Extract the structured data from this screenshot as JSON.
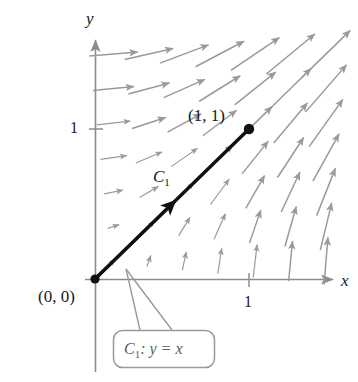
{
  "figure": {
    "axes": {
      "x_label": "x",
      "y_label": "y",
      "x_tick_label": "1",
      "y_tick_label": "1"
    },
    "points": {
      "origin_label": "(0, 0)",
      "endpoint_label": "(1, 1)"
    },
    "curve": {
      "label": "C",
      "label_sub": "1",
      "callout_name": "C",
      "callout_sub": "1",
      "callout_equation": ": y = x"
    },
    "colors": {
      "axis": "#8c8c8c",
      "field_arrow": "#9a9a9a",
      "curve": "#101010",
      "callout_border": "#9a9a9a",
      "callout_text": "#5e5e5e",
      "text": "#171717",
      "background": "#ffffff"
    }
  },
  "chart_data": {
    "type": "scatter",
    "title": "",
    "xlabel": "x",
    "ylabel": "y",
    "xlim": [
      -0.22,
      1.72
    ],
    "ylim": [
      -0.55,
      1.75
    ],
    "grid": false,
    "legend": null,
    "vector_field": {
      "description": "F = <y, x>",
      "fx": "y",
      "fy": "x",
      "grid_x": [
        0.12,
        0.35,
        0.58,
        0.81,
        1.04,
        1.27,
        1.5
      ],
      "grid_y": [
        0.12,
        0.35,
        0.58,
        0.81,
        1.04,
        1.27,
        1.5
      ],
      "arrow_scale": 0.21,
      "color": "#9a9a9a"
    },
    "curves": [
      {
        "name": "C1",
        "equation": "y = x",
        "from": [
          0,
          0
        ],
        "to": [
          1,
          1
        ],
        "direction": "increasing",
        "color": "#101010",
        "endpoints_marked": [
          [
            0,
            0
          ],
          [
            1,
            1
          ]
        ]
      }
    ],
    "annotations": [
      {
        "text": "(0, 0)",
        "at": [
          0,
          0
        ]
      },
      {
        "text": "(1, 1)",
        "at": [
          1,
          1
        ]
      },
      {
        "text": "C1",
        "at": [
          0.42,
          0.55
        ]
      },
      {
        "text": "C1: y = x",
        "at": [
          0.35,
          -0.42
        ]
      }
    ],
    "xticks": [
      1
    ],
    "yticks": [
      1
    ]
  }
}
